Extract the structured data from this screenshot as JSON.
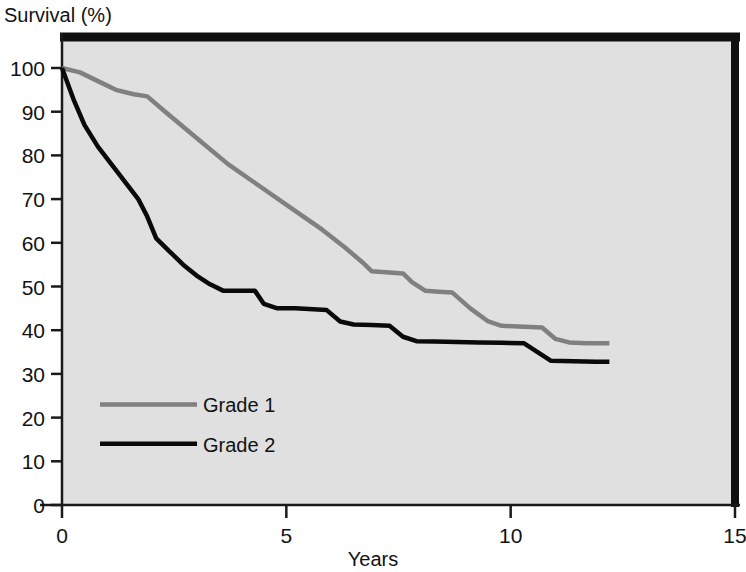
{
  "chart_data": {
    "type": "line",
    "title": "",
    "xlabel": "Years",
    "ylabel": "Survival (%)",
    "xlim": [
      0,
      15
    ],
    "ylim": [
      0,
      100
    ],
    "grid": false,
    "legend_position": "inside-lower-left",
    "xticks": [
      0,
      5,
      10,
      15
    ],
    "xtick_labels": [
      "0",
      "5",
      "10",
      "15"
    ],
    "yticks": [
      0,
      10,
      20,
      30,
      40,
      50,
      60,
      70,
      80,
      90,
      100
    ],
    "ytick_labels": [
      "0",
      "10",
      "20",
      "30",
      "40",
      "50",
      "60",
      "70",
      "80",
      "90",
      "100"
    ],
    "series": [
      {
        "name": "Grade 1",
        "color": "#808080",
        "points": [
          [
            0.0,
            100
          ],
          [
            0.4,
            99
          ],
          [
            0.8,
            97
          ],
          [
            1.2,
            95
          ],
          [
            1.6,
            94
          ],
          [
            1.9,
            93.5
          ],
          [
            2.3,
            90
          ],
          [
            3.0,
            84
          ],
          [
            3.7,
            78
          ],
          [
            4.4,
            73
          ],
          [
            5.1,
            68
          ],
          [
            5.8,
            63
          ],
          [
            6.3,
            59
          ],
          [
            6.7,
            55.5
          ],
          [
            6.9,
            53.5
          ],
          [
            7.3,
            53.2
          ],
          [
            7.6,
            53
          ],
          [
            7.8,
            51
          ],
          [
            8.1,
            49
          ],
          [
            8.4,
            48.8
          ],
          [
            8.7,
            48.6
          ],
          [
            9.1,
            45
          ],
          [
            9.5,
            42
          ],
          [
            9.8,
            41
          ],
          [
            10.3,
            40.8
          ],
          [
            10.7,
            40.6
          ],
          [
            11.0,
            38
          ],
          [
            11.3,
            37.2
          ],
          [
            11.7,
            37
          ],
          [
            12.2,
            37
          ]
        ]
      },
      {
        "name": "Grade 2",
        "color": "#0a0a0a",
        "points": [
          [
            0.0,
            100
          ],
          [
            0.25,
            93
          ],
          [
            0.5,
            87
          ],
          [
            0.8,
            82
          ],
          [
            1.1,
            78
          ],
          [
            1.4,
            74
          ],
          [
            1.7,
            70
          ],
          [
            1.9,
            66
          ],
          [
            2.1,
            61
          ],
          [
            2.4,
            58
          ],
          [
            2.7,
            55
          ],
          [
            3.0,
            52.5
          ],
          [
            3.3,
            50.5
          ],
          [
            3.6,
            49
          ],
          [
            4.0,
            49
          ],
          [
            4.3,
            49
          ],
          [
            4.5,
            46
          ],
          [
            4.8,
            45
          ],
          [
            5.2,
            45
          ],
          [
            5.6,
            44.8
          ],
          [
            5.9,
            44.6
          ],
          [
            6.2,
            42
          ],
          [
            6.5,
            41.3
          ],
          [
            6.9,
            41.2
          ],
          [
            7.3,
            41
          ],
          [
            7.6,
            38.5
          ],
          [
            7.9,
            37.5
          ],
          [
            8.3,
            37.4
          ],
          [
            8.8,
            37.3
          ],
          [
            9.3,
            37.2
          ],
          [
            9.8,
            37.1
          ],
          [
            10.3,
            37
          ],
          [
            10.6,
            35
          ],
          [
            10.9,
            33
          ],
          [
            11.4,
            32.9
          ],
          [
            11.9,
            32.8
          ],
          [
            12.2,
            32.8
          ]
        ]
      }
    ]
  },
  "legend": {
    "entries": [
      {
        "label": "Grade 1",
        "color": "#808080",
        "swatch_y_value": 23
      },
      {
        "label": "Grade 2",
        "color": "#0a0a0a",
        "swatch_y_value": 14
      }
    ]
  },
  "colors": {
    "plot_background": "#e0e0e0",
    "frame": "#101010",
    "axis": "#1a1a1a",
    "text": "#121212",
    "grade1": "#808080",
    "grade2": "#0a0a0a"
  }
}
